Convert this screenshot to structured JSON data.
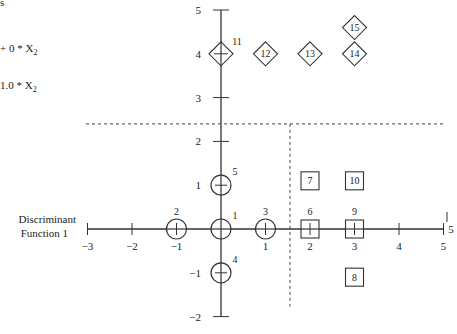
{
  "chart_data": {
    "type": "scatter",
    "title": "",
    "xlabel": "Discriminant Function 1",
    "ylabel": "",
    "xlim": [
      -3,
      5
    ],
    "ylim": [
      -2,
      5
    ],
    "x_ticks": [
      "-3",
      "-2",
      "-1",
      "1",
      "2",
      "3",
      "4",
      "5"
    ],
    "y_ticks": [
      "5",
      "4",
      "3",
      "2",
      "1",
      "-1",
      "-2"
    ],
    "partial_formulas": [
      "+ 0 * X2",
      "1.0 * X2"
    ],
    "top_left_fragment": "s",
    "right_edge_label": "5",
    "dashed_boundaries": [
      {
        "orientation": "horizontal",
        "y": 2.4
      },
      {
        "orientation": "vertical",
        "x": 1.55,
        "from_y": 2.4,
        "to_y": -2
      }
    ],
    "series": [
      {
        "name": "circles",
        "marker": "circle",
        "points": [
          {
            "id": "1",
            "x": 0,
            "y": 0
          },
          {
            "id": "2",
            "x": -1,
            "y": 0
          },
          {
            "id": "3",
            "x": 1,
            "y": 0
          },
          {
            "id": "4",
            "x": 0,
            "y": -1
          },
          {
            "id": "5",
            "x": 0,
            "y": 1
          }
        ]
      },
      {
        "name": "squares",
        "marker": "square",
        "points": [
          {
            "id": "6",
            "x": 2,
            "y": 0
          },
          {
            "id": "7",
            "x": 2,
            "y": 1.1
          },
          {
            "id": "8",
            "x": 3,
            "y": -1.1
          },
          {
            "id": "9",
            "x": 3,
            "y": 0
          },
          {
            "id": "10",
            "x": 3,
            "y": 1.1
          }
        ]
      },
      {
        "name": "diamonds",
        "marker": "diamond",
        "points": [
          {
            "id": "11",
            "x": 0,
            "y": 4
          },
          {
            "id": "12",
            "x": 1,
            "y": 4
          },
          {
            "id": "13",
            "x": 2,
            "y": 4
          },
          {
            "id": "14",
            "x": 3,
            "y": 4
          },
          {
            "id": "15",
            "x": 3,
            "y": 4.6
          }
        ]
      }
    ]
  },
  "labels": {
    "x_axis_line1": "Discriminant",
    "x_axis_line2": "Function 1",
    "formula1": "+ 0 * X",
    "formula1_sub": "2",
    "formula2": "1.0 * X",
    "formula2_sub": "2",
    "fragment": "s",
    "right_edge": "5"
  }
}
